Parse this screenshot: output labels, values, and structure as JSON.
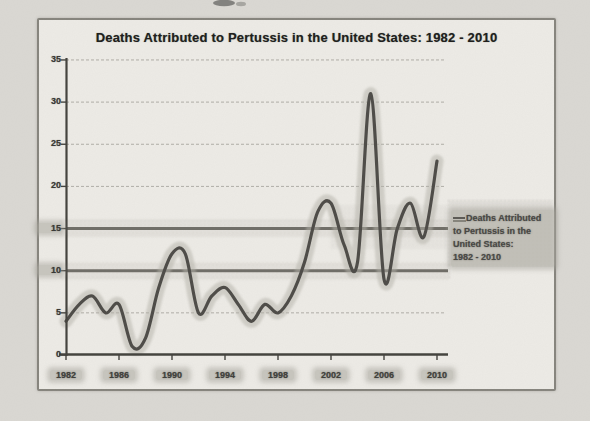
{
  "figure": {
    "title": "Deaths Attributed to Pertussis in the United States: 1982 - 2010"
  },
  "legend": {
    "lines": [
      "Deaths Attributed",
      "to Pertussis in the",
      "United States:",
      "1982 - 2010"
    ]
  },
  "colors": {
    "page_bg": "#dad8d3",
    "figure_bg": "#edebe6",
    "frame_border": "#85837c",
    "curve": "#504e4a",
    "curve_halo": "#b3b1a8",
    "grid": "#a09e97",
    "grid_highlighted": "#6b6962",
    "axis": "#45443f",
    "highlighter_smudge": "#a8a69d",
    "title_text": "#201f1d"
  },
  "chart_data": {
    "type": "line",
    "title": "Deaths Attributed to Pertussis in the United States: 1982 - 2010",
    "series_name": "Deaths Attributed to Pertussis in the United States: 1982 - 2010",
    "x": [
      1982,
      1983,
      1984,
      1985,
      1986,
      1987,
      1988,
      1989,
      1990,
      1991,
      1992,
      1993,
      1994,
      1995,
      1996,
      1997,
      1998,
      1999,
      2000,
      2001,
      2002,
      2003,
      2004,
      2005,
      2006,
      2007,
      2008,
      2009,
      2010
    ],
    "values": [
      4,
      6,
      7,
      5,
      6,
      1,
      2,
      8,
      12,
      12,
      5,
      7,
      8,
      6,
      4,
      6,
      5,
      7,
      11,
      17,
      18,
      13,
      11,
      31,
      9,
      15,
      18,
      14,
      23
    ],
    "xlabel": "",
    "ylabel": "",
    "ylim": [
      0,
      35
    ],
    "xlim": [
      1982,
      2010
    ],
    "y_ticks": [
      35,
      30,
      25,
      20,
      15,
      10,
      5,
      0
    ],
    "x_tick_labels": [
      "1982",
      "1986",
      "1990",
      "1994",
      "1998",
      "2002",
      "2006",
      "2010"
    ],
    "x_tick_years": [
      1982,
      1986,
      1990,
      1994,
      1998,
      2002,
      2006,
      2010
    ],
    "highlighted_y_gridlines": [
      15,
      10
    ],
    "grid": true,
    "legend_position": "right",
    "line_style": "smooth"
  }
}
